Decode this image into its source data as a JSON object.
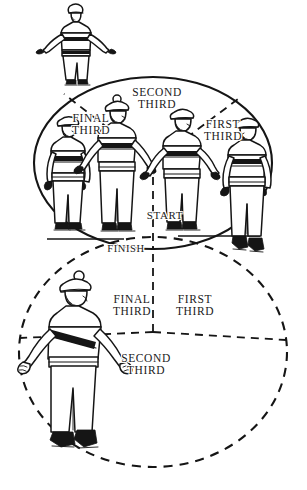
{
  "figure": {
    "ink_color": "#151515",
    "paper_color": "#ffffff"
  },
  "labels": {
    "top_lobe": [
      {
        "id": "second-third",
        "text": "SECOND\nTHIRD",
        "x": 126,
        "y": 86,
        "size": 11.5
      },
      {
        "id": "final-third",
        "text": "FINAL\nTHIRD",
        "x": 65,
        "y": 112,
        "size": 11.5
      },
      {
        "id": "first-third",
        "text": "FIRST\nTHIRD",
        "x": 197,
        "y": 118,
        "size": 11.5
      },
      {
        "id": "start",
        "text": "START",
        "x": 143,
        "y": 210,
        "size": 11
      },
      {
        "id": "finish",
        "text": "FINISH",
        "x": 104,
        "y": 243,
        "size": 10.5
      }
    ],
    "bottom_lobe": [
      {
        "id": "final-third-2",
        "text": "FINAL\nTHIRD",
        "x": 109,
        "y": 293,
        "size": 11.5
      },
      {
        "id": "first-third-2",
        "text": "FIRST\nTHIRD",
        "x": 172,
        "y": 293,
        "size": 11.5
      },
      {
        "id": "second-third-2",
        "text": "SECOND\nTHIRD",
        "x": 115,
        "y": 352,
        "size": 11.5
      }
    ]
  },
  "skaters": [
    {
      "id": "skater-top-outside",
      "position": "above upper lobe apex"
    },
    {
      "id": "skater-final-third-left",
      "position": "upper lobe, final third"
    },
    {
      "id": "skater-second-third-mid",
      "position": "upper lobe, second third"
    },
    {
      "id": "skater-first-third-mid",
      "position": "upper lobe, first third"
    },
    {
      "id": "skater-first-third-right",
      "position": "upper lobe, right edge"
    },
    {
      "id": "skater-bottom-lobe",
      "position": "lower lobe, left of centre"
    }
  ]
}
